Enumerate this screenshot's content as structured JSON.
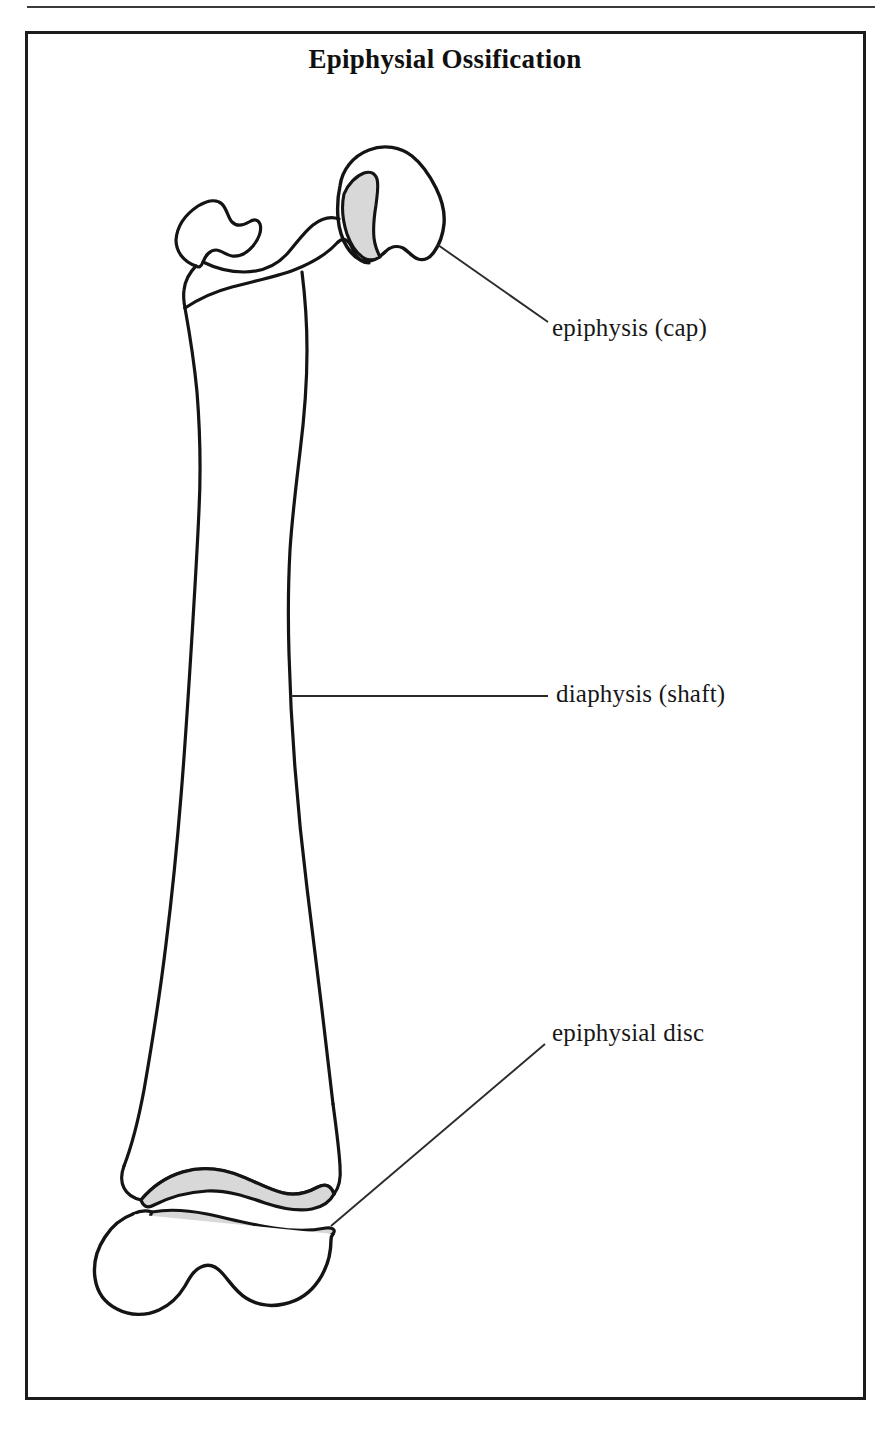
{
  "figure": {
    "title": "Epiphysial Ossification",
    "type": "anatomical-line-diagram",
    "frame": {
      "border_color": "#1c1c1c",
      "background": "#ffffff"
    },
    "colors": {
      "outline": "#141414",
      "cartilage_fill": "#d8d8d8",
      "leader_line": "#2b2b2b",
      "text": "#171717",
      "rule": "#3b3b3b"
    }
  },
  "labels": [
    {
      "id": "epiphysis-cap",
      "text": "epiphysis (cap)"
    },
    {
      "id": "diaphysis-shaft",
      "text": "diaphysis (shaft)"
    },
    {
      "id": "epiphysial-disc",
      "text": "epiphysial disc"
    }
  ],
  "caption": {
    "partial_text": "clipped line of body text below the figure frame"
  }
}
